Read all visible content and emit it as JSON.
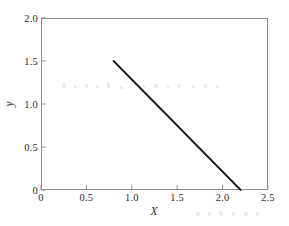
{
  "chart_data": {
    "type": "line",
    "title": "",
    "xlabel": "X",
    "ylabel": "y",
    "xlim": [
      0,
      2.5
    ],
    "ylim": [
      0,
      2.0
    ],
    "grid": false,
    "legend": null,
    "xticks": [
      0,
      0.5,
      1.0,
      1.5,
      2.0,
      2.5
    ],
    "xtick_labels": [
      "0",
      "0.5",
      "1.0",
      "1.5",
      "2.0",
      "2.5"
    ],
    "yticks": [
      0,
      0.5,
      1.0,
      1.5,
      2.0
    ],
    "ytick_labels": [
      "0",
      "0.5",
      "1.0",
      "1.5",
      "2.0"
    ],
    "tick_direction": "in",
    "series": [
      {
        "name": "constraint-line",
        "style": "solid",
        "color": "#1a1a1a",
        "linewidth": 1.8,
        "x": [
          0.8,
          2.2
        ],
        "y": [
          1.5,
          0.0
        ]
      }
    ],
    "annotations": []
  },
  "axes": {
    "frame_color": "#8c8c8c",
    "background": "#ffffff"
  }
}
